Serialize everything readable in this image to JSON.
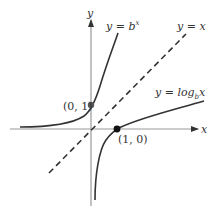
{
  "diagram": {
    "axes": {
      "x_label": "x",
      "y_label": "y"
    },
    "curves": [
      {
        "id": "exponential",
        "label_prefix": "y = b",
        "label_sup": "x"
      },
      {
        "id": "identity",
        "label": "y = x",
        "style": "dashed"
      },
      {
        "id": "logarithm",
        "label_prefix": "y = log",
        "label_sub": "b",
        "label_suffix": "x"
      }
    ],
    "points": [
      {
        "label": "(0, 1)"
      },
      {
        "label": "(1, 0)"
      }
    ],
    "colors": {
      "axis": "#888888",
      "curve": "#333333",
      "point": "#444444",
      "point_dark": "#111111"
    }
  }
}
